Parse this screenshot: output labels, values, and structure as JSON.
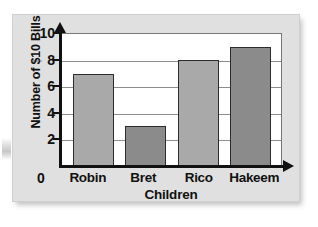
{
  "chart_data": {
    "type": "bar",
    "title": "",
    "xlabel": "Children",
    "ylabel": "Number of $10 Bills",
    "categories": [
      "Robin",
      "Bret",
      "Rico",
      "Hakeem"
    ],
    "values": [
      7,
      3,
      8,
      9
    ],
    "ylim": [
      0,
      10
    ],
    "ytick_labels": [
      "0",
      "2",
      "4",
      "6",
      "8",
      "10"
    ],
    "ytick_values": [
      0,
      2,
      4,
      6,
      8,
      10
    ],
    "grid": "horizontal-major",
    "legend": "none",
    "bar_colors": [
      "#a9a9a9",
      "#8b8b8b",
      "#a9a9a9",
      "#8b8b8b"
    ],
    "bar_edge_color": "#2c2c2c",
    "axis_color": "#111111",
    "gridline_color": "#8d8d8d",
    "plot_background": "#ffffff",
    "card_background": "#e0e0e0",
    "y_axis_arrow": true,
    "x_axis_arrow": true
  },
  "origin": {
    "label": "0"
  }
}
